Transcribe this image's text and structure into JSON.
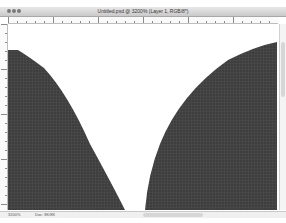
{
  "window": {
    "title": "Untitled.psd @ 3200% (Layer 1, RGB/8*)",
    "traffic_lights": [
      "close",
      "minimize",
      "zoom"
    ]
  },
  "rulers": {
    "horizontal_major_ticks_px": [
      8,
      57,
      147,
      192,
      238
    ],
    "vertical_major_ticks_px": [
      40,
      100,
      175
    ]
  },
  "canvas": {
    "background": "#ffffff",
    "shape_fill": "#3e3e3e",
    "grid_color": "#5a5a5a",
    "shapes": [
      {
        "name": "left-curved-shape",
        "description": "dark pixel region on left with curved right edge"
      },
      {
        "name": "right-curved-shape",
        "description": "dark pixel region on right with curved left edge"
      }
    ]
  },
  "status": {
    "zoom": "3200%",
    "doc_info": "Doc: 8K/8K"
  },
  "colors": {
    "titlebar": "#d4d4d4",
    "ruler": "#fafafa",
    "shape": "#3e3e3e"
  }
}
